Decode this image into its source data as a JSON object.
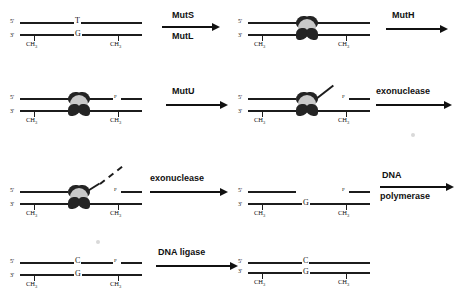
{
  "diagram": {
    "end_labels": {
      "five_prime": "5'",
      "three_prime": "3'"
    },
    "methyl_label": "CH",
    "methyl_sub": "3",
    "nick_marker": "P"
  },
  "arrows": [
    {
      "id": "arrow-muts-mutl",
      "above": "MutS",
      "below": "MutL"
    },
    {
      "id": "arrow-muth",
      "above": "MutH",
      "below": ""
    },
    {
      "id": "arrow-mutu",
      "above": "MutU",
      "below": ""
    },
    {
      "id": "arrow-exonuclease-1",
      "above": "exonuclease",
      "below": ""
    },
    {
      "id": "arrow-exonuclease-2",
      "above": "exonuclease",
      "below": ""
    },
    {
      "id": "arrow-dna-polymerase",
      "above": "DNA",
      "below": "polymerase"
    },
    {
      "id": "arrow-dna-ligase",
      "above": "DNA ligase",
      "below": ""
    }
  ],
  "panels": [
    {
      "id": "panel-1-mismatch",
      "top_base": "T",
      "bottom_base": "G",
      "methyl_left": "CH",
      "methyl_right": "CH"
    },
    {
      "id": "panel-2-mutsl-bound",
      "top_base": "",
      "bottom_base": "",
      "methyl_left": "CH",
      "methyl_right": "CH"
    },
    {
      "id": "panel-3-nicked",
      "top_base": "",
      "bottom_base": "",
      "methyl_left": "CH",
      "methyl_right": "CH",
      "nick": "P"
    },
    {
      "id": "panel-4-unwound",
      "top_base": "",
      "bottom_base": "",
      "methyl_left": "CH",
      "methyl_right": "CH",
      "nick": "P"
    },
    {
      "id": "panel-5-degrading",
      "top_base": "",
      "bottom_base": "",
      "methyl_left": "CH",
      "methyl_right": "CH",
      "nick": "P"
    },
    {
      "id": "panel-6-excised-gap",
      "top_base": "",
      "bottom_base": "G",
      "methyl_left": "CH",
      "methyl_right": "CH",
      "nick": "P"
    },
    {
      "id": "panel-7-resynthesized",
      "top_base": "C",
      "bottom_base": "G",
      "methyl_left": "CH",
      "methyl_right": "CH",
      "nick": "P"
    },
    {
      "id": "panel-8-repaired",
      "top_base": "C",
      "bottom_base": "G",
      "methyl_left": "CH",
      "methyl_right": "CH"
    }
  ]
}
